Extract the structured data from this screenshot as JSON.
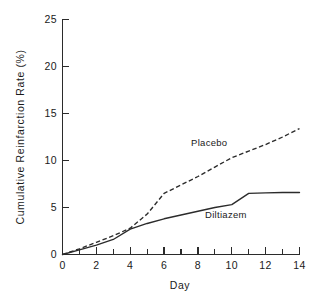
{
  "chart_data": {
    "type": "line",
    "title": "",
    "subtitle": "",
    "xlabel": "Day",
    "ylabel": "Cumulative Reinfarction Rate (%)",
    "xlim": [
      0,
      14
    ],
    "ylim": [
      0,
      25
    ],
    "grid": false,
    "legend_position": "inline-annotations",
    "x_ticks_major": [
      0,
      2,
      4,
      6,
      8,
      10,
      12,
      14
    ],
    "x_tick_labels": [
      "0",
      "2",
      "4",
      "6",
      "8",
      "10",
      "12",
      "14"
    ],
    "x_ticks_minor": [
      1,
      3,
      5,
      7,
      9,
      11,
      13
    ],
    "y_ticks_major": [
      0,
      5,
      10,
      15,
      20,
      25
    ],
    "y_tick_labels": [
      "0",
      "5",
      "10",
      "15",
      "20",
      "25"
    ],
    "series": [
      {
        "name": "Placebo",
        "style": "dashed",
        "color": "#2b2b2b",
        "label_position": {
          "x": 7.3,
          "y": 11.0
        },
        "x": [
          0,
          1,
          2,
          3,
          4,
          5,
          5.5,
          6,
          7,
          8,
          9,
          10,
          11,
          12,
          13,
          14
        ],
        "values": [
          0,
          0.6,
          1.3,
          2.0,
          2.8,
          4.3,
          5.4,
          6.5,
          7.4,
          8.3,
          9.3,
          10.3,
          11.0,
          11.7,
          12.5,
          13.4
        ]
      },
      {
        "name": "Diltiazem",
        "style": "solid",
        "color": "#2b2b2b",
        "label_position": {
          "x": 8.6,
          "y": 2.7
        },
        "x": [
          0,
          1,
          2,
          3,
          4,
          5,
          6,
          7,
          8,
          9,
          10,
          11,
          12,
          13,
          14
        ],
        "values": [
          0,
          0.5,
          1.0,
          1.6,
          2.7,
          3.3,
          3.8,
          4.2,
          4.6,
          5.0,
          5.3,
          6.5,
          6.55,
          6.6,
          6.6
        ]
      }
    ]
  },
  "figure": {
    "x_axis_title": "Day",
    "y_axis_title": "Cumulative Reinfarction Rate (%)",
    "placebo_label": "Placebo",
    "diltiazem_label": "Diltiazem"
  }
}
